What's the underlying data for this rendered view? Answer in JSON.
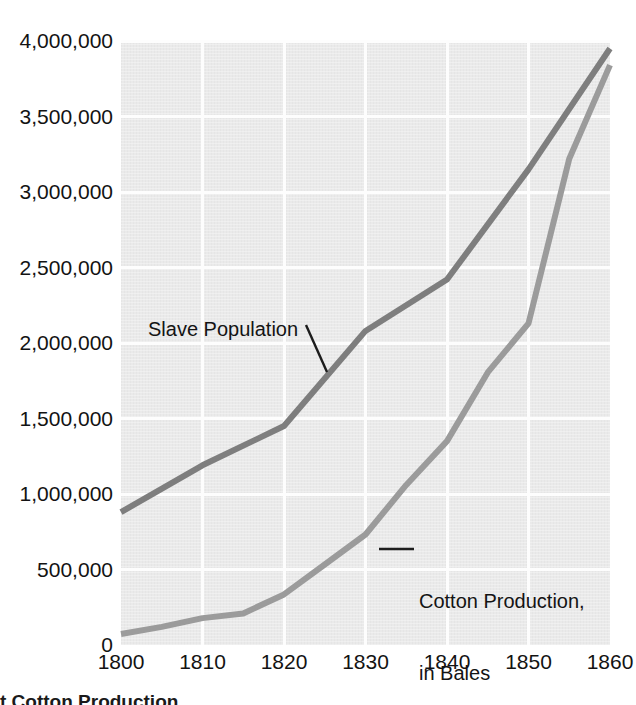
{
  "chart_data": {
    "type": "line",
    "title": "",
    "subtitle": "",
    "xlabel": "",
    "ylabel": "",
    "xlim": [
      1800,
      1860
    ],
    "ylim": [
      0,
      4000000
    ],
    "grid": true,
    "legend_position": "inline-annotations",
    "x_ticks": [
      "1800",
      "1810",
      "1820",
      "1830",
      "1840",
      "1850",
      "1860"
    ],
    "x_tick_values": [
      1800,
      1810,
      1820,
      1830,
      1840,
      1850,
      1860
    ],
    "y_ticks": [
      "0",
      "500,000",
      "1,000,000",
      "1,500,000",
      "2,000,000",
      "2,500,000",
      "3,000,000",
      "3,500,000",
      "4,000,000"
    ],
    "y_tick_values": [
      0,
      500000,
      1000000,
      1500000,
      2000000,
      2500000,
      3000000,
      3500000,
      4000000
    ],
    "series": [
      {
        "name": "Slave Population",
        "color": "#7e7e7e",
        "x": [
          1800,
          1810,
          1820,
          1830,
          1840,
          1850,
          1860
        ],
        "values": [
          880000,
          1190000,
          1450000,
          2080000,
          2420000,
          3150000,
          3950000
        ]
      },
      {
        "name": "Cotton Production, in Bales",
        "color": "#9b9b9b",
        "x": [
          1800,
          1805,
          1810,
          1815,
          1820,
          1825,
          1830,
          1835,
          1840,
          1845,
          1850,
          1855,
          1860
        ],
        "values": [
          73000,
          120000,
          178000,
          209000,
          335000,
          533000,
          732000,
          1060000,
          1350000,
          1805000,
          2130000,
          3220000,
          3840000
        ]
      }
    ],
    "annotations": [
      {
        "text": "Slave Population",
        "target_series": "Slave Population"
      },
      {
        "text": "Cotton Production,",
        "target_series": "Cotton Production, in Bales"
      },
      {
        "text": "in Bales",
        "target_series": "Cotton Production, in Bales"
      }
    ],
    "colors": {
      "panel_background": "#eaeaea",
      "gridline": "#fdfdfd",
      "page_background": "#ffffff",
      "text": "#131313",
      "slave_line": "#7e7e7e",
      "cotton_line": "#9b9b9b"
    }
  },
  "caption": {
    "partial_text": "t Cotton Production"
  }
}
